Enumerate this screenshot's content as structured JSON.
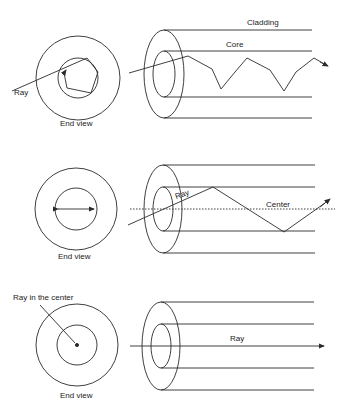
{
  "colors": {
    "line": "#2a2a2a",
    "background": "#ffffff"
  },
  "panels": [
    {
      "name": "skew-ray",
      "end_view_label": "End view",
      "ray_label": "Ray",
      "cladding_label": "Cladding",
      "core_label": "Core"
    },
    {
      "name": "meridional-ray",
      "end_view_label": "End view",
      "ray_label": "Ray",
      "center_label": "Center"
    },
    {
      "name": "axial-ray",
      "end_view_label": "End view",
      "ray_label": "Ray",
      "center_ray_label": "Ray in the center"
    }
  ]
}
